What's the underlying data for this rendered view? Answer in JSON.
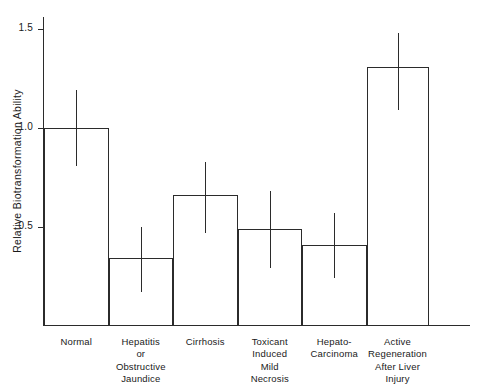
{
  "chart_data": {
    "type": "bar",
    "title": "",
    "xlabel": "",
    "ylabel": "Relative Biotransformation Ability",
    "ylim": [
      0,
      1.6
    ],
    "grid": false,
    "legend": null,
    "ytick_labels": [
      "0.5",
      "1.0",
      "1.5"
    ],
    "ytick_values": [
      0.5,
      1.0,
      1.5
    ],
    "categories": [
      "Normal",
      "Hepatitis or Obstructive Jaundice",
      "Cirrhosis",
      "Toxicant Induced Mild Necrosis",
      "Hepato-Carcinoma",
      "Active Regeneration After Liver Injury"
    ],
    "category_lines": [
      [
        "Normal"
      ],
      [
        "Hepatitis",
        "or",
        "Obstructive",
        "Jaundice"
      ],
      [
        "Cirrhosis"
      ],
      [
        "Toxicant",
        "Induced",
        "Mild",
        "Necrosis"
      ],
      [
        "Hepato-",
        "Carcinoma"
      ],
      [
        "Active",
        "Regeneration",
        "After Liver",
        "Injury"
      ]
    ],
    "values": [
      1.0,
      0.34,
      0.66,
      0.49,
      0.41,
      1.31
    ],
    "error_low": [
      0.81,
      0.17,
      0.47,
      0.29,
      0.24,
      1.09
    ],
    "error_high": [
      1.19,
      0.5,
      0.83,
      0.68,
      0.57,
      1.48
    ],
    "bar_style": "outline",
    "bar_color": "#ffffff",
    "bar_edge_color": "#2b2b2b",
    "error_color": "#2b2b2b"
  },
  "axis": {
    "y_label_text": "Relative Biotransformation Ability"
  }
}
